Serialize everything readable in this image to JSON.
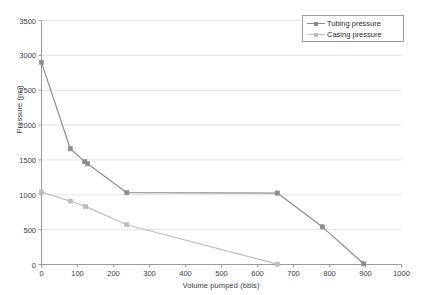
{
  "chart_data": {
    "type": "line",
    "title": "",
    "xlabel": "Volume pumped (bbls)",
    "ylabel": "Pressure (psi)",
    "xlim": [
      0,
      1000
    ],
    "ylim": [
      0,
      3500
    ],
    "xticks": [
      0,
      100,
      200,
      300,
      400,
      500,
      600,
      700,
      800,
      900,
      1000
    ],
    "yticks": [
      0,
      500,
      1000,
      1500,
      2000,
      2500,
      3000,
      3500
    ],
    "grid": "horizontal",
    "legend_position": "top-right",
    "series": [
      {
        "name": "Tubing pressure",
        "color": "#8c8c8c",
        "marker": "square",
        "x": [
          0,
          80,
          120,
          128,
          237,
          655,
          780,
          895
        ],
        "y": [
          2900,
          1660,
          1475,
          1445,
          1030,
          1025,
          540,
          10
        ]
      },
      {
        "name": "Casing pressure",
        "color": "#bdbdbd",
        "marker": "square",
        "x": [
          0,
          80,
          123,
          237,
          655
        ],
        "y": [
          1040,
          910,
          830,
          570,
          5
        ]
      }
    ]
  },
  "legend": {
    "entries": [
      {
        "label": "Tubing pressure"
      },
      {
        "label": "Casing pressure"
      }
    ]
  },
  "colors": {
    "tubing": "#8c8c8c",
    "casing": "#bdbdbd",
    "grid": "#e2e2e2",
    "axis": "#9a9a9a",
    "text": "#3a3a3a"
  }
}
